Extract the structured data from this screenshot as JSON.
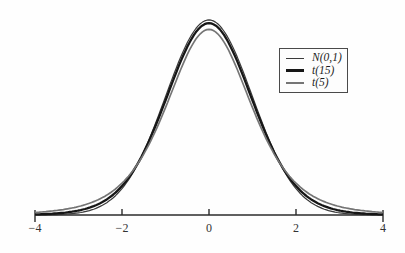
{
  "figure": {
    "kind": "statistical distribution comparison plot",
    "background_color": "#fefefe",
    "axis_color": "#2b2b2b",
    "tick_label_color": "#333333"
  },
  "chart_data": {
    "type": "line",
    "title": "",
    "xlabel": "",
    "ylabel": "",
    "xlim": [
      -4,
      4
    ],
    "ylim": [
      0,
      0.41
    ],
    "grid": false,
    "legend_position": "upper right",
    "x_ticks": [
      {
        "value": -4,
        "label": "−4"
      },
      {
        "value": -2,
        "label": "−2"
      },
      {
        "value": 0,
        "label": "0"
      },
      {
        "value": 2,
        "label": "2"
      },
      {
        "value": 4,
        "label": "4"
      }
    ],
    "sample_x": [
      0,
      0.5,
      1.0,
      1.5,
      2.0,
      2.5,
      3.0,
      3.5,
      4.0
    ],
    "symmetric_about_zero": true,
    "series": [
      {
        "name": "N(0,1)",
        "distribution": "normal",
        "df": null,
        "peak": 0.39894,
        "color": "#3a3a3a",
        "stroke_width": 1.2,
        "values_at_sample_x": [
          0.3989,
          0.3521,
          0.242,
          0.1295,
          0.054,
          0.0175,
          0.0044,
          0.0009,
          0.0001
        ]
      },
      {
        "name": "t(15)",
        "distribution": "t",
        "df": 15,
        "peak": 0.39235,
        "color": "#161616",
        "stroke_width": 2.3,
        "values_at_sample_x": [
          0.3924,
          0.3438,
          0.2341,
          0.1283,
          0.0592,
          0.0242,
          0.0091,
          0.0033,
          0.0012
        ]
      },
      {
        "name": "t(5)",
        "distribution": "t",
        "df": 5,
        "peak": 0.37961,
        "color": "#757575",
        "stroke_width": 1.7,
        "values_at_sample_x": [
          0.3796,
          0.3279,
          0.2197,
          0.1245,
          0.0651,
          0.0333,
          0.0173,
          0.0092,
          0.0051
        ]
      }
    ]
  }
}
